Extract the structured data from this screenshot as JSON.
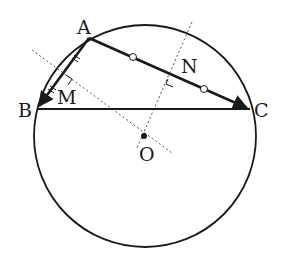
{
  "diagram": {
    "colors": {
      "stroke": "#1a1a1a",
      "dotted": "#555555",
      "background": "#ffffff"
    },
    "circle": {
      "center_label": "O",
      "cx": 145,
      "cy": 136,
      "r": 111
    },
    "points": {
      "A": {
        "label": "A",
        "x": 89,
        "y": 38
      },
      "B": {
        "label": "B",
        "x": 37,
        "y": 109
      },
      "C": {
        "label": "C",
        "x": 250,
        "y": 109
      },
      "M": {
        "label": "M"
      },
      "N": {
        "label": "N"
      },
      "O": {
        "label": "O",
        "x": 144,
        "y": 136
      }
    },
    "segments": [
      "AB (arrow to B)",
      "AC (arrow to C)",
      "BC"
    ],
    "markers": {
      "AM_MB": "double tick marks (equal lengths)",
      "AN_NC": "circle marks (equal lengths)",
      "right_angles": [
        "at M",
        "at N"
      ]
    },
    "labels": {
      "A": "A",
      "B": "B",
      "C": "C",
      "M": "M",
      "N": "N",
      "O": "O"
    }
  }
}
